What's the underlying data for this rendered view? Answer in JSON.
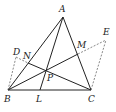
{
  "diagram": {
    "type": "geometry-figure",
    "points": {
      "A": {
        "label": "A",
        "x": 63,
        "y": 17,
        "lx": 59,
        "ly": 12
      },
      "B": {
        "label": "B",
        "x": 8,
        "y": 90,
        "lx": 4,
        "ly": 102
      },
      "C": {
        "label": "C",
        "x": 91,
        "y": 90,
        "lx": 88,
        "ly": 102
      },
      "L": {
        "label": "L",
        "x": 40,
        "y": 90,
        "lx": 36,
        "ly": 102
      },
      "P": {
        "label": "P",
        "x": 45,
        "y": 70,
        "lx": 47,
        "ly": 81
      },
      "M": {
        "label": "M",
        "x": 78,
        "y": 54,
        "lx": 77,
        "ly": 48
      },
      "E": {
        "label": "E",
        "x": 106,
        "y": 40,
        "lx": 103,
        "ly": 35
      },
      "N": {
        "label": "N",
        "x": 28,
        "y": 63,
        "lx": 23,
        "ly": 59
      },
      "D": {
        "label": "D",
        "x": 16,
        "y": 57,
        "lx": 13,
        "ly": 55
      }
    },
    "solid_segments": [
      "AB",
      "AC",
      "BC",
      "AL",
      "BM",
      "CN"
    ],
    "dashed_segments": [
      "BD",
      "DN",
      "ME",
      "CE"
    ]
  }
}
